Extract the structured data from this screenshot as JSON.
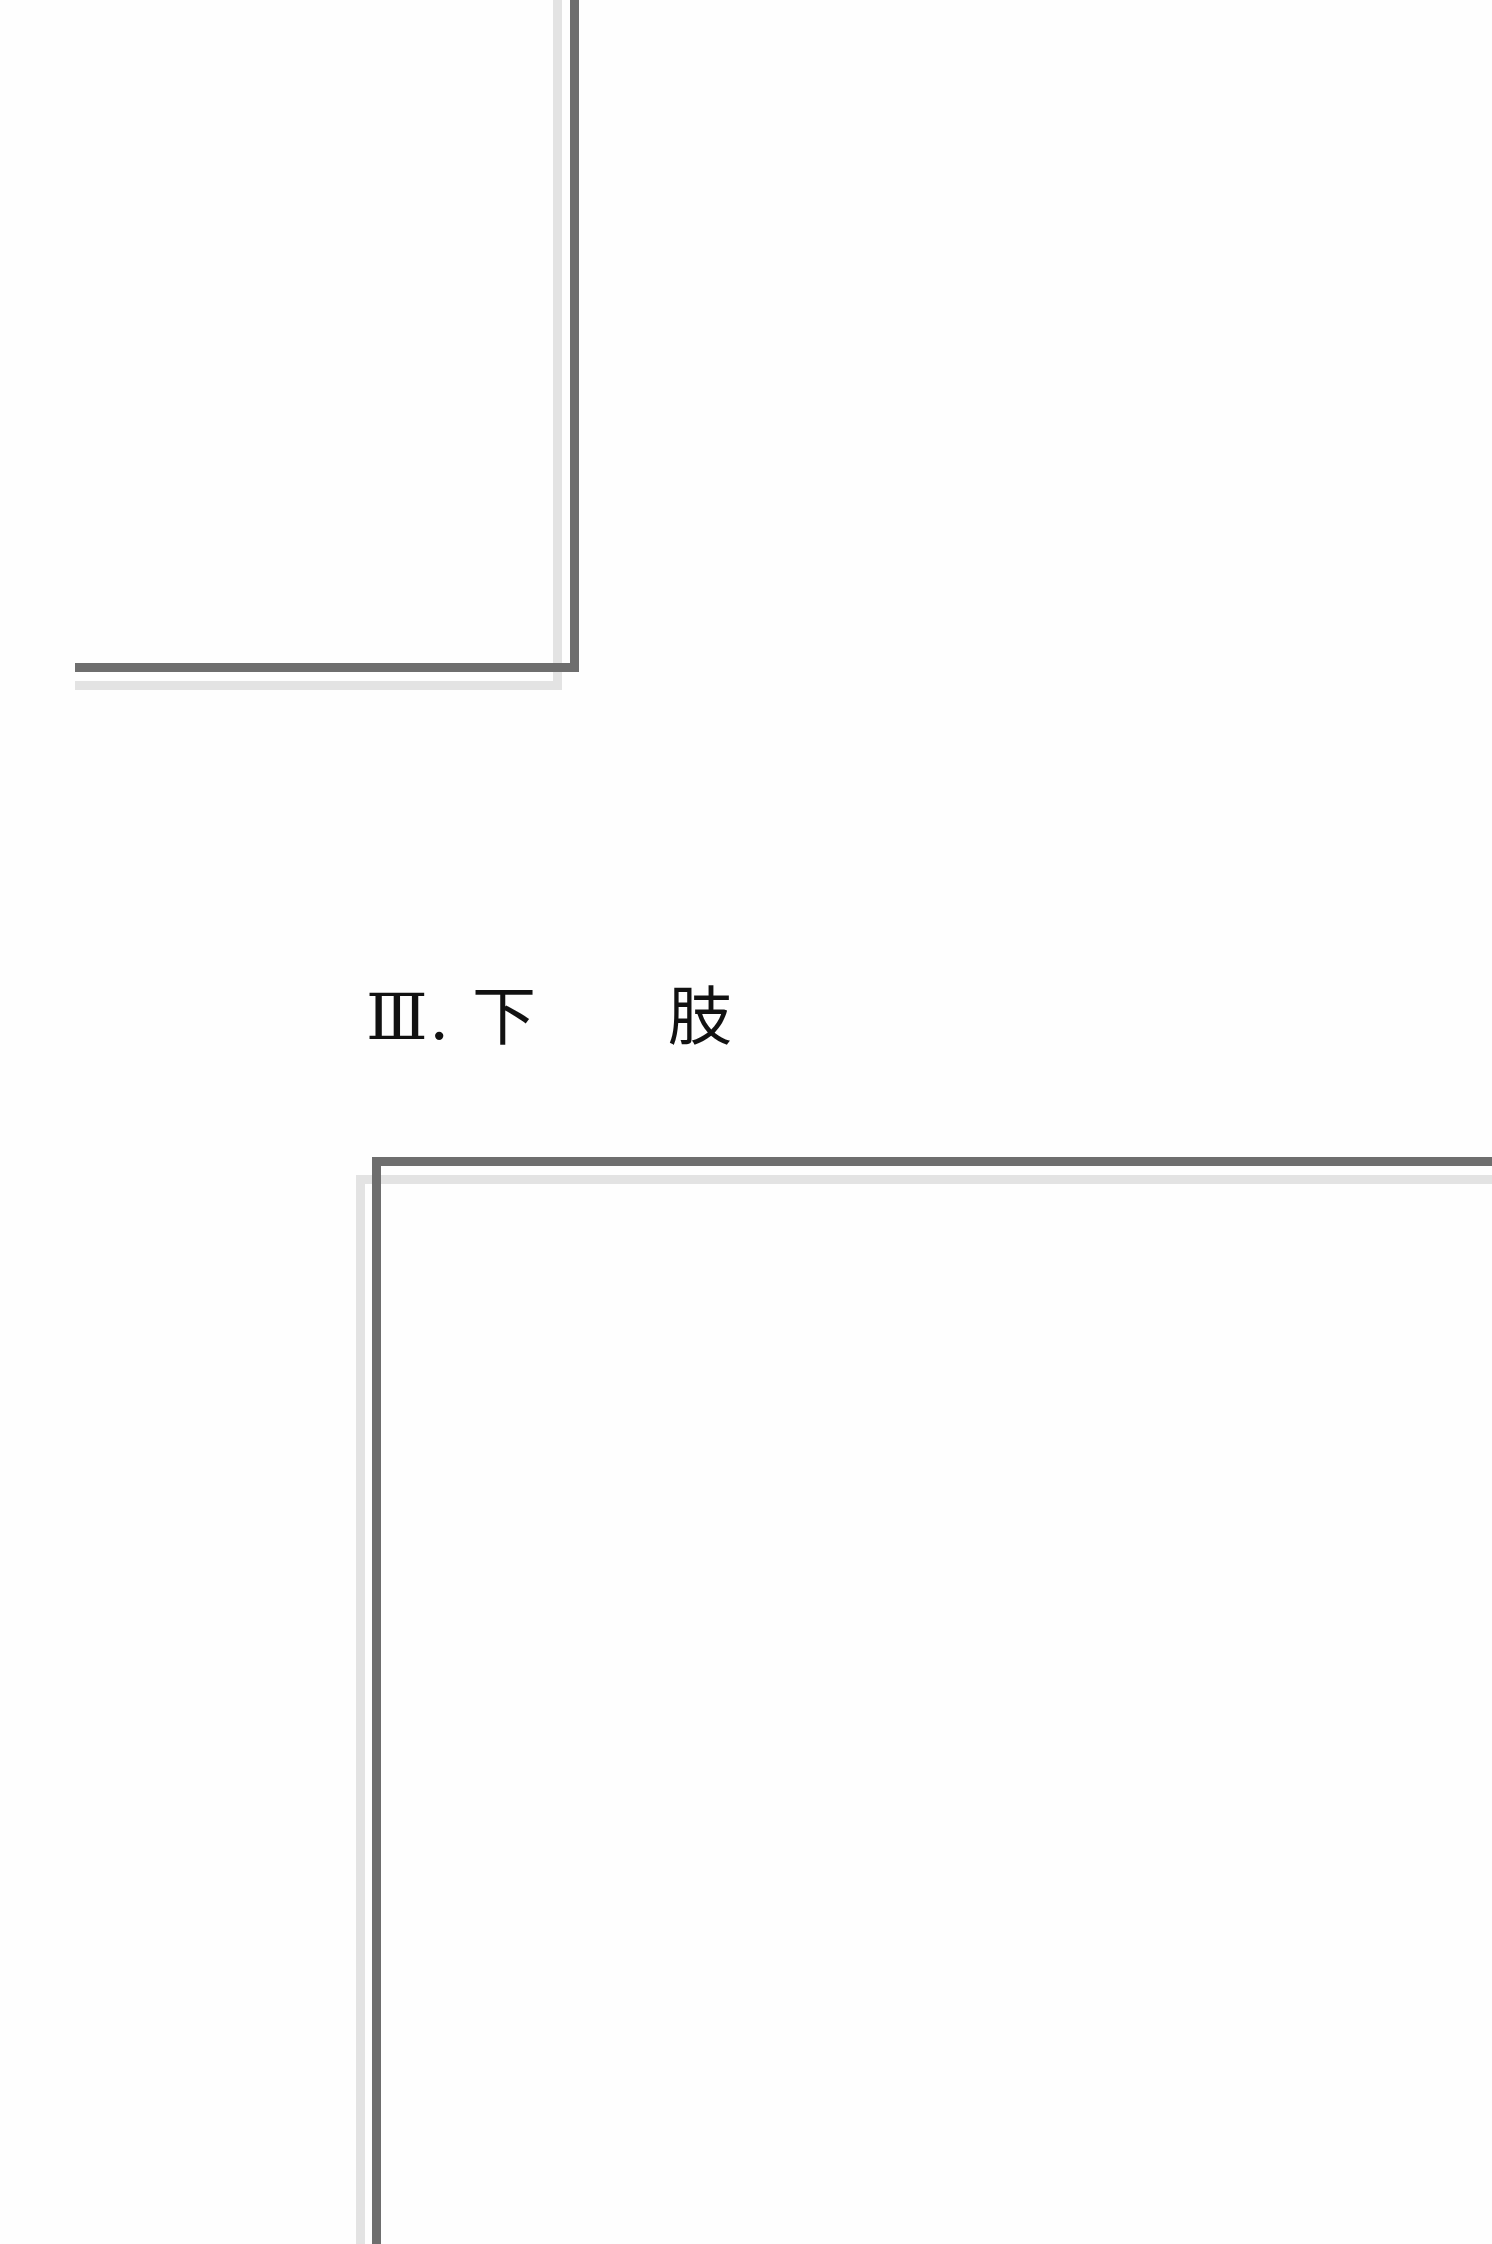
{
  "page": {
    "background_color": "#fefefe",
    "width": 1492,
    "height": 2244
  },
  "heading": {
    "text": "Ⅲ. 下　　肢",
    "numeral": "Ⅲ",
    "separator": ".",
    "title": "下　　肢",
    "color": "#111111"
  },
  "rules": {
    "dark_color": "#6e6e6e",
    "light_color": "#e3e3e3",
    "upper_frame": {
      "name": "upper-right-corner-rule",
      "vertical_dark": {
        "x": 570,
        "y": 0,
        "w": 9,
        "h": 672
      },
      "vertical_light": {
        "x": 553,
        "y": 0,
        "w": 9,
        "h": 690
      },
      "horizontal_dark": {
        "x": 75,
        "y": 663,
        "w": 504,
        "h": 9
      },
      "horizontal_light": {
        "x": 75,
        "y": 681,
        "w": 487,
        "h": 9
      }
    },
    "lower_frame": {
      "name": "lower-left-corner-rule",
      "horizontal_dark": {
        "x": 372,
        "y": 1157,
        "w": 1120,
        "h": 9
      },
      "horizontal_light": {
        "x": 356,
        "y": 1175,
        "w": 1136,
        "h": 9
      },
      "vertical_dark": {
        "x": 372,
        "y": 1157,
        "w": 9,
        "h": 1087
      },
      "vertical_light": {
        "x": 356,
        "y": 1175,
        "w": 9,
        "h": 1069
      }
    }
  }
}
